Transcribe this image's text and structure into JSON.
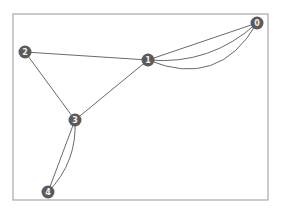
{
  "diagram": {
    "type": "multigraph",
    "frame": {
      "x": 13,
      "y": 14,
      "width": 255,
      "height": 186,
      "stroke": "#a8a8a8"
    },
    "node_color": "#5b5b5b",
    "label_color": "#f2f2f2",
    "edge_color": "#6a6a6a",
    "nodes": [
      {
        "id": "0",
        "label": "0",
        "x": 257,
        "y": 23
      },
      {
        "id": "1",
        "label": "1",
        "x": 148,
        "y": 60
      },
      {
        "id": "2",
        "label": "2",
        "x": 25,
        "y": 52
      },
      {
        "id": "3",
        "label": "3",
        "x": 75,
        "y": 120
      },
      {
        "id": "4",
        "label": "4",
        "x": 48,
        "y": 192
      }
    ],
    "edges": [
      {
        "source": "1",
        "target": "0",
        "curve": 0
      },
      {
        "source": "1",
        "target": "0",
        "curve": 1
      },
      {
        "source": "1",
        "target": "0",
        "curve": 2
      },
      {
        "source": "2",
        "target": "1",
        "curve": 0
      },
      {
        "source": "2",
        "target": "3",
        "curve": 0
      },
      {
        "source": "1",
        "target": "3",
        "curve": 0
      },
      {
        "source": "3",
        "target": "4",
        "curve": 0
      },
      {
        "source": "3",
        "target": "4",
        "curve": 1
      }
    ]
  }
}
